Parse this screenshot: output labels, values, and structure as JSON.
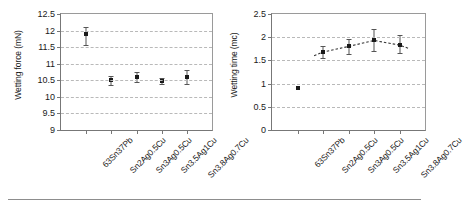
{
  "figure": {
    "background": "#ffffff",
    "marker_color": "#1a1a1a",
    "grid_color": "#b9b9b9",
    "axis_color": "#777777"
  },
  "chart_data": [
    {
      "type": "scatter",
      "panel": "left",
      "title": "",
      "xlabel": "",
      "ylabel": "Wetting force (mN)",
      "ylim": [
        9,
        12.5
      ],
      "yticks": [
        9,
        9.5,
        10,
        10.5,
        11,
        11.5,
        12,
        12.5
      ],
      "ytick_labels": [
        "9",
        "9.5",
        "10",
        "10.5",
        "11",
        "11.5",
        "12",
        "12.5"
      ],
      "grid": true,
      "grid_axis": "y",
      "legend": "none",
      "categories": [
        "63Sn37Pb",
        "Sn2Ag0.5Cu",
        "Sn3Ag0.5Cu",
        "Sn3.5Ag1Cu",
        "Sn3.8Ag0.7Cu"
      ],
      "values": [
        11.9,
        10.5,
        10.6,
        10.48,
        10.6
      ],
      "error_low": [
        11.55,
        10.35,
        10.45,
        10.4,
        10.38
      ],
      "error_high": [
        12.1,
        10.62,
        10.75,
        10.57,
        10.82
      ],
      "trendline": false
    },
    {
      "type": "scatter",
      "panel": "right",
      "title": "",
      "xlabel": "",
      "ylabel": "Wetting time (mc)",
      "ylim": [
        0,
        2.5
      ],
      "yticks": [
        0,
        0.5,
        1,
        1.5,
        2,
        2.5
      ],
      "ytick_labels": [
        "0",
        "0.5",
        "1",
        "1.5",
        "2",
        "2.5"
      ],
      "grid": true,
      "grid_axis": "y",
      "legend": "none",
      "categories": [
        "63Sn37Pb",
        "Sn2Ag0.5Cu",
        "Sn3Ag0.5Cu",
        "Sn3.5Ag1Cu",
        "Sn3.8Ag0.7Cu"
      ],
      "values": [
        0.9,
        1.68,
        1.8,
        1.93,
        1.83
      ],
      "error_low": [
        0.9,
        1.55,
        1.63,
        1.7,
        1.65
      ],
      "error_high": [
        0.9,
        1.82,
        1.97,
        2.18,
        2.05
      ],
      "trendline": true,
      "trendline_style": "dashed",
      "trendline_points": [
        {
          "x": 1.65,
          "y": 1.6
        },
        {
          "x": 2.0,
          "y": 1.68
        },
        {
          "x": 3.0,
          "y": 1.8
        },
        {
          "x": 4.0,
          "y": 1.93
        },
        {
          "x": 5.0,
          "y": 1.83
        },
        {
          "x": 5.35,
          "y": 1.76
        }
      ]
    }
  ]
}
